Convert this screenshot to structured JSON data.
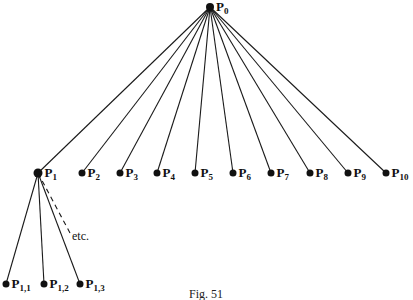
{
  "diagram": {
    "root": {
      "id": "P0",
      "label": "P",
      "sub": "0",
      "x": 210,
      "y": 7
    },
    "level1": [
      {
        "id": "P1",
        "label": "P",
        "sub": "1",
        "x": 38,
        "y": 173
      },
      {
        "id": "P2",
        "label": "P",
        "sub": "2",
        "x": 82,
        "y": 173
      },
      {
        "id": "P3",
        "label": "P",
        "sub": "3",
        "x": 120,
        "y": 173
      },
      {
        "id": "P4",
        "label": "P",
        "sub": "4",
        "x": 157,
        "y": 173
      },
      {
        "id": "P5",
        "label": "P",
        "sub": "5",
        "x": 195,
        "y": 173
      },
      {
        "id": "P6",
        "label": "P",
        "sub": "6",
        "x": 233,
        "y": 173
      },
      {
        "id": "P7",
        "label": "P",
        "sub": "7",
        "x": 271,
        "y": 173
      },
      {
        "id": "P8",
        "label": "P",
        "sub": "8",
        "x": 310,
        "y": 173
      },
      {
        "id": "P9",
        "label": "P",
        "sub": "9",
        "x": 348,
        "y": 173
      },
      {
        "id": "P10",
        "label": "P",
        "sub": "10",
        "x": 386,
        "y": 173
      }
    ],
    "level2": [
      {
        "id": "P1,1",
        "label": "P",
        "sub": "1,1",
        "x": 6,
        "y": 284
      },
      {
        "id": "P1,2",
        "label": "P",
        "sub": "1,2",
        "x": 44,
        "y": 284
      },
      {
        "id": "P1,3",
        "label": "P",
        "sub": "1,3",
        "x": 80,
        "y": 284
      }
    ],
    "continuation": {
      "label": "etc.",
      "x": 72,
      "y": 240,
      "dash_end_x": 70,
      "dash_end_y": 233
    },
    "caption": "Fig. 51",
    "colors": {
      "line": "#1a1a1a",
      "node": "#111111",
      "background": "#ffffff"
    }
  }
}
